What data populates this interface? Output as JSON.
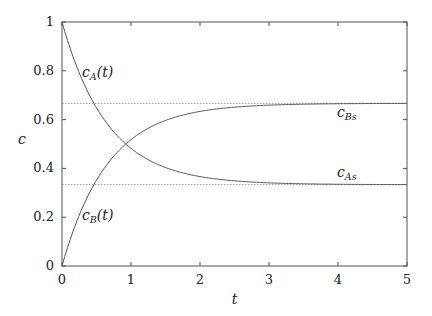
{
  "chart_data": {
    "type": "line",
    "title": "",
    "xlabel": "t",
    "ylabel": "c",
    "xlim": [
      0,
      5
    ],
    "ylim": [
      0,
      1
    ],
    "xticks": [
      "0",
      "1",
      "2",
      "3",
      "4",
      "5"
    ],
    "yticks": [
      "0",
      "0.2",
      "0.4",
      "0.6",
      "0.8",
      "1"
    ],
    "grid": false,
    "legend": "none (inline curve labels)",
    "series": [
      {
        "name": "c_A(t)",
        "label_main": "c",
        "label_sub": "A",
        "label_tail": "(t)",
        "formula": "1/3 + (2/3) exp(-1.5 t)",
        "x": [
          0,
          0.5,
          1,
          1.5,
          2,
          3,
          4,
          5
        ],
        "values": [
          1.0,
          0.649,
          0.482,
          0.403,
          0.366,
          0.341,
          0.335,
          0.334
        ]
      },
      {
        "name": "c_B(t)",
        "label_main": "c",
        "label_sub": "B",
        "label_tail": "(t)",
        "formula": "(2/3) (1 - exp(-1.5 t))",
        "x": [
          0,
          0.5,
          1,
          1.5,
          2,
          3,
          4,
          5
        ],
        "values": [
          0.0,
          0.351,
          0.518,
          0.597,
          0.634,
          0.659,
          0.665,
          0.666
        ]
      }
    ],
    "reference_lines": [
      {
        "name": "c_Bs",
        "label_main": "c",
        "label_sub": "Bs",
        "y": 0.6667,
        "style": "dotted"
      },
      {
        "name": "c_As",
        "label_main": "c",
        "label_sub": "As",
        "y": 0.3333,
        "style": "dotted"
      }
    ]
  }
}
